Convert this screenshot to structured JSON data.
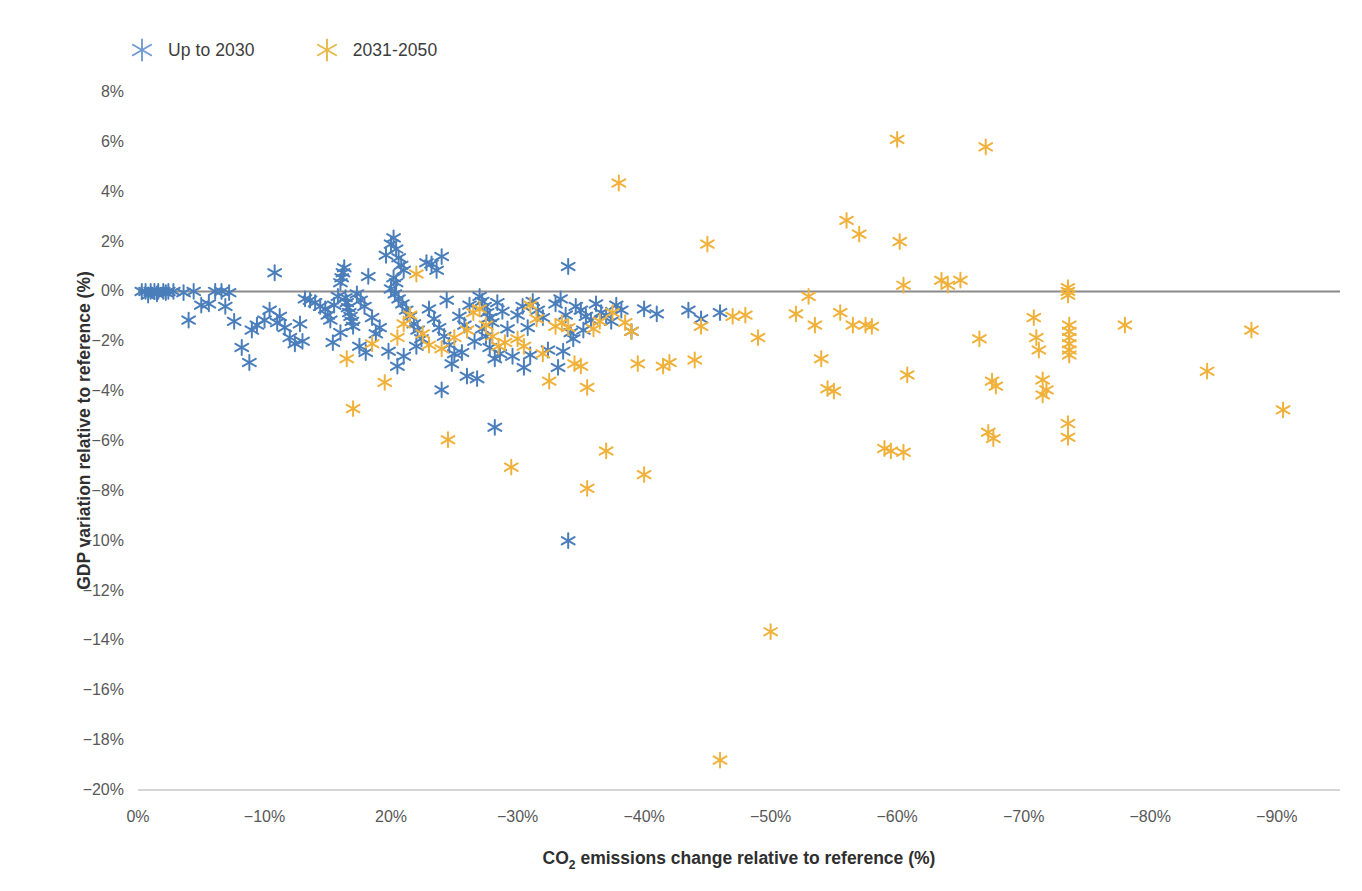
{
  "chart_data": {
    "type": "scatter",
    "title": "",
    "xlabel": "CO2 emissions change relative to reference (%)",
    "ylabel": "GDP variation relative to reference (%)",
    "xlim": [
      0,
      -95
    ],
    "ylim": [
      -20,
      8
    ],
    "grid": false,
    "legend_position": "top-left",
    "reference_line": {
      "y": 0,
      "color": "#8a8a8a"
    },
    "x_tick_labels": [
      "0%",
      "-10%",
      "20%",
      "-30%",
      "-40%",
      "-50%",
      "-60%",
      "-70%",
      "-80%",
      "-90%"
    ],
    "x_tick_values": [
      0,
      -10,
      -20,
      -30,
      -40,
      -50,
      -60,
      -70,
      -80,
      -90
    ],
    "y_tick_labels": [
      "8%",
      "6%",
      "4%",
      "2%",
      "0%",
      "-2%",
      "-4%",
      "-6%",
      "-8%",
      "-10%",
      "-12%",
      "-14%",
      "-16%",
      "-18%",
      "-20%"
    ],
    "y_tick_values": [
      8,
      6,
      4,
      2,
      0,
      -2,
      -4,
      -6,
      -8,
      -10,
      -12,
      -14,
      -16,
      -18,
      -20
    ],
    "series": [
      {
        "name": "Up to 2030",
        "color": "#4a7ebb",
        "marker": "asterisk-six",
        "points": [
          [
            -0.3,
            0.0
          ],
          [
            -0.6,
            0.0
          ],
          [
            -1.0,
            0.0
          ],
          [
            -1.3,
            0.0
          ],
          [
            -1.6,
            0.0
          ],
          [
            -2.0,
            0.0
          ],
          [
            -2.4,
            0.0
          ],
          [
            -2.8,
            0.0
          ],
          [
            -0.8,
            -0.15
          ],
          [
            -1.5,
            -0.1
          ],
          [
            -2.2,
            -0.05
          ],
          [
            -3.6,
            -0.05
          ],
          [
            -4.4,
            0.0
          ],
          [
            -5.0,
            -0.55
          ],
          [
            -5.6,
            -0.5
          ],
          [
            -4.0,
            -1.15
          ],
          [
            -6.1,
            0.0
          ],
          [
            -6.6,
            0.0
          ],
          [
            -7.2,
            -0.05
          ],
          [
            -6.9,
            -0.6
          ],
          [
            -7.6,
            -1.2
          ],
          [
            -8.2,
            -2.25
          ],
          [
            -8.8,
            -2.85
          ],
          [
            -9.4,
            -1.35
          ],
          [
            -10.0,
            -1.15
          ],
          [
            -10.4,
            -0.75
          ],
          [
            -10.8,
            0.75
          ],
          [
            -11.2,
            -1.0
          ],
          [
            -11.6,
            -1.45
          ],
          [
            -12.0,
            -1.85
          ],
          [
            -12.4,
            -2.1
          ],
          [
            -12.8,
            -1.3
          ],
          [
            -11.0,
            -1.25
          ],
          [
            -13.2,
            -0.3
          ],
          [
            -13.6,
            -0.35
          ],
          [
            -14.0,
            -0.45
          ],
          [
            -14.4,
            -0.6
          ],
          [
            -14.8,
            -0.7
          ],
          [
            -15.0,
            -0.95
          ],
          [
            -15.2,
            -1.15
          ],
          [
            -15.5,
            -0.55
          ],
          [
            -15.8,
            -0.2
          ],
          [
            -16.0,
            0.35
          ],
          [
            -16.1,
            0.55
          ],
          [
            -16.2,
            0.75
          ],
          [
            -16.3,
            0.95
          ],
          [
            -16.4,
            -0.25
          ],
          [
            -16.5,
            -0.45
          ],
          [
            -16.6,
            -0.65
          ],
          [
            -16.7,
            -0.85
          ],
          [
            -16.8,
            -1.0
          ],
          [
            -16.9,
            -1.2
          ],
          [
            -17.0,
            -1.4
          ],
          [
            -16.0,
            -1.65
          ],
          [
            -15.4,
            -2.05
          ],
          [
            -17.3,
            -0.1
          ],
          [
            -17.6,
            -0.35
          ],
          [
            -17.9,
            -0.6
          ],
          [
            -18.2,
            0.6
          ],
          [
            -18.5,
            -1.05
          ],
          [
            -18.8,
            -1.7
          ],
          [
            -19.1,
            -1.45
          ],
          [
            -17.5,
            -2.2
          ],
          [
            -19.6,
            1.45
          ],
          [
            -20.0,
            1.9
          ],
          [
            -20.2,
            2.15
          ],
          [
            -20.4,
            1.7
          ],
          [
            -20.6,
            1.35
          ],
          [
            -20.8,
            1.05
          ],
          [
            -21.0,
            0.85
          ],
          [
            -20.2,
            0.55
          ],
          [
            -20.4,
            0.35
          ],
          [
            -20.0,
            0.1
          ],
          [
            -20.3,
            -0.1
          ],
          [
            -20.6,
            -0.3
          ],
          [
            -20.9,
            -0.5
          ],
          [
            -21.2,
            -0.75
          ],
          [
            -21.5,
            -1.0
          ],
          [
            -21.8,
            -1.3
          ],
          [
            -22.1,
            -1.55
          ],
          [
            -22.4,
            -1.9
          ],
          [
            -22.0,
            -2.2
          ],
          [
            -21.0,
            -2.6
          ],
          [
            -20.5,
            -3.0
          ],
          [
            -19.8,
            -2.4
          ],
          [
            -22.8,
            1.15
          ],
          [
            -23.2,
            1.1
          ],
          [
            -23.6,
            0.85
          ],
          [
            -24.0,
            1.4
          ],
          [
            -24.4,
            -0.35
          ],
          [
            -23.0,
            -0.7
          ],
          [
            -23.4,
            -1.1
          ],
          [
            -23.8,
            -1.45
          ],
          [
            -24.2,
            -1.8
          ],
          [
            -24.6,
            -2.15
          ],
          [
            -25.0,
            -2.5
          ],
          [
            -24.0,
            -3.95
          ],
          [
            -25.4,
            -1.0
          ],
          [
            -25.8,
            -1.35
          ],
          [
            -26.2,
            -0.55
          ],
          [
            -26.6,
            -2.0
          ],
          [
            -25.6,
            -2.45
          ],
          [
            -26.0,
            -3.4
          ],
          [
            -27.0,
            -0.2
          ],
          [
            -27.2,
            -0.4
          ],
          [
            -27.4,
            -0.6
          ],
          [
            -27.6,
            -0.85
          ],
          [
            -27.8,
            -1.05
          ],
          [
            -27.2,
            -1.5
          ],
          [
            -27.5,
            -1.8
          ],
          [
            -27.8,
            -2.25
          ],
          [
            -28.2,
            -2.7
          ],
          [
            -28.0,
            -1.25
          ],
          [
            -28.4,
            -0.45
          ],
          [
            -28.8,
            -0.8
          ],
          [
            -29.2,
            -1.5
          ],
          [
            -28.6,
            -2.5
          ],
          [
            -28.2,
            -5.45
          ],
          [
            -29.6,
            -2.6
          ],
          [
            -30.0,
            -0.95
          ],
          [
            -30.4,
            -0.6
          ],
          [
            -30.8,
            -1.45
          ],
          [
            -31.2,
            -0.4
          ],
          [
            -31.6,
            -0.75
          ],
          [
            -32.0,
            -1.05
          ],
          [
            -32.4,
            -2.35
          ],
          [
            -31.0,
            -2.55
          ],
          [
            -33.0,
            -0.5
          ],
          [
            -33.4,
            -0.3
          ],
          [
            -33.8,
            -0.95
          ],
          [
            -34.0,
            1.0
          ],
          [
            -34.2,
            -1.65
          ],
          [
            -34.4,
            -1.9
          ],
          [
            -33.6,
            -2.4
          ],
          [
            -33.2,
            -3.05
          ],
          [
            -34.6,
            -0.6
          ],
          [
            -35.0,
            -0.75
          ],
          [
            -35.4,
            -1.0
          ],
          [
            -35.8,
            -1.15
          ],
          [
            -36.2,
            -0.5
          ],
          [
            -36.6,
            -0.85
          ],
          [
            -35.2,
            -1.55
          ],
          [
            -37.0,
            -0.95
          ],
          [
            -37.4,
            -1.2
          ],
          [
            -37.8,
            -0.55
          ],
          [
            -38.2,
            -0.75
          ],
          [
            -34.0,
            -10.0
          ],
          [
            -39.0,
            -1.6
          ],
          [
            -40.0,
            -0.7
          ],
          [
            -41.0,
            -0.9
          ],
          [
            -43.5,
            -0.75
          ],
          [
            -44.5,
            -1.1
          ],
          [
            -46.0,
            -0.85
          ],
          [
            -30.5,
            -3.05
          ],
          [
            -26.8,
            -3.5
          ],
          [
            -24.8,
            -2.9
          ],
          [
            -18.0,
            -2.45
          ],
          [
            -13.0,
            -2.0
          ],
          [
            -9.0,
            -1.55
          ]
        ]
      },
      {
        "name": "2031-2050",
        "color": "#f0b13b",
        "marker": "asterisk-six",
        "points": [
          [
            -16.5,
            -2.7
          ],
          [
            -17.0,
            -4.7
          ],
          [
            -18.5,
            -2.1
          ],
          [
            -19.5,
            -3.65
          ],
          [
            -20.5,
            -1.85
          ],
          [
            -21.0,
            -1.3
          ],
          [
            -21.5,
            -0.95
          ],
          [
            -22.0,
            0.7
          ],
          [
            -22.5,
            -1.7
          ],
          [
            -23.0,
            -2.15
          ],
          [
            -24.0,
            -2.3
          ],
          [
            -24.5,
            -5.95
          ],
          [
            -25.0,
            -1.85
          ],
          [
            -26.0,
            -1.55
          ],
          [
            -26.5,
            -0.85
          ],
          [
            -27.0,
            -0.7
          ],
          [
            -27.5,
            -1.35
          ],
          [
            -28.0,
            -1.8
          ],
          [
            -28.5,
            -2.2
          ],
          [
            -29.0,
            -2.05
          ],
          [
            -29.5,
            -7.05
          ],
          [
            -30.0,
            -1.9
          ],
          [
            -30.5,
            -2.2
          ],
          [
            -31.0,
            -0.55
          ],
          [
            -31.5,
            -1.1
          ],
          [
            -32.0,
            -2.5
          ],
          [
            -32.5,
            -3.6
          ],
          [
            -33.0,
            -1.4
          ],
          [
            -33.5,
            -1.25
          ],
          [
            -34.0,
            -1.45
          ],
          [
            -34.5,
            -2.9
          ],
          [
            -35.0,
            -3.0
          ],
          [
            -35.5,
            -3.85
          ],
          [
            -35.5,
            -7.9
          ],
          [
            -36.0,
            -1.5
          ],
          [
            -36.5,
            -1.2
          ],
          [
            -37.0,
            -6.4
          ],
          [
            -37.5,
            -0.85
          ],
          [
            -38.0,
            4.35
          ],
          [
            -38.5,
            -1.25
          ],
          [
            -39.0,
            -1.6
          ],
          [
            -40.0,
            -7.35
          ],
          [
            -41.5,
            -3.0
          ],
          [
            -44.0,
            -2.75
          ],
          [
            -45.0,
            1.9
          ],
          [
            -46.0,
            -18.8
          ],
          [
            -47.0,
            -1.0
          ],
          [
            -48.0,
            -0.95
          ],
          [
            -49.0,
            -1.85
          ],
          [
            -50.0,
            -13.65
          ],
          [
            -53.0,
            -0.2
          ],
          [
            -53.5,
            -1.35
          ],
          [
            -54.0,
            -2.7
          ],
          [
            -54.5,
            -3.9
          ],
          [
            -55.0,
            -4.0
          ],
          [
            -55.5,
            -0.85
          ],
          [
            -56.0,
            2.85
          ],
          [
            -57.0,
            2.3
          ],
          [
            -56.5,
            -1.35
          ],
          [
            -57.5,
            -1.35
          ],
          [
            -59.0,
            -6.3
          ],
          [
            -59.5,
            -6.4
          ],
          [
            -60.0,
            6.1
          ],
          [
            -60.2,
            2.0
          ],
          [
            -60.5,
            0.25
          ],
          [
            -60.8,
            -3.35
          ],
          [
            -60.5,
            -6.45
          ],
          [
            -63.5,
            0.45
          ],
          [
            -64.0,
            0.25
          ],
          [
            -65.0,
            0.45
          ],
          [
            -66.5,
            -1.9
          ],
          [
            -67.0,
            5.8
          ],
          [
            -67.5,
            -3.6
          ],
          [
            -67.8,
            -3.8
          ],
          [
            -67.2,
            -5.65
          ],
          [
            -67.6,
            -5.9
          ],
          [
            -71.5,
            -3.55
          ],
          [
            -71.8,
            -3.95
          ],
          [
            -71.5,
            -4.15
          ],
          [
            -71.2,
            -2.35
          ],
          [
            -71.0,
            -1.85
          ],
          [
            -70.8,
            -1.05
          ],
          [
            -73.5,
            0.0
          ],
          [
            -73.5,
            -0.15
          ],
          [
            -73.5,
            0.15
          ],
          [
            -73.6,
            -1.35
          ],
          [
            -73.6,
            -1.6
          ],
          [
            -73.6,
            -1.85
          ],
          [
            -73.6,
            -2.1
          ],
          [
            -73.6,
            -2.35
          ],
          [
            -73.6,
            -2.55
          ],
          [
            -73.5,
            -5.3
          ],
          [
            -73.5,
            -5.85
          ],
          [
            -78.0,
            -1.35
          ],
          [
            -84.5,
            -3.2
          ],
          [
            -88.0,
            -1.55
          ],
          [
            -90.5,
            -4.75
          ],
          [
            -58.0,
            -1.4
          ],
          [
            -52.0,
            -0.9
          ],
          [
            -44.5,
            -1.4
          ],
          [
            -42.0,
            -2.85
          ],
          [
            -39.5,
            -2.9
          ]
        ]
      }
    ]
  }
}
